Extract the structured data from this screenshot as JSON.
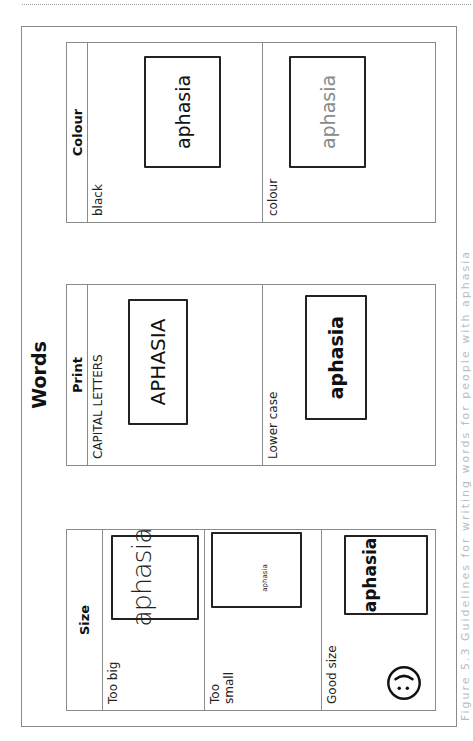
{
  "document": {
    "title": "Words",
    "caption": "Figure 5.3  Guidelines for writing words for people with aphasia"
  },
  "tables": {
    "size": {
      "header": "Size",
      "rows": [
        {
          "label": "Too big",
          "sample": "aphasia"
        },
        {
          "label": "Too\nsmall",
          "sample": "aphasia"
        },
        {
          "label": "Good size",
          "sample": "aphasia",
          "icon": "smiley-face-icon"
        }
      ]
    },
    "print": {
      "header": "Print",
      "rows": [
        {
          "label": "CAPITAL LETTERS",
          "sample": "APHASIA"
        },
        {
          "label": "Lower case",
          "sample": "aphasia"
        }
      ]
    },
    "colour": {
      "header": "Colour",
      "rows": [
        {
          "label": "black",
          "sample": "aphasia",
          "color": "#111111"
        },
        {
          "label": "colour",
          "sample": "aphasia",
          "color": "#8a8a8a"
        }
      ]
    }
  },
  "colors": {
    "text": "#111111",
    "rule": "#8a8a8a",
    "colour_sample": "#8a8a8a"
  }
}
